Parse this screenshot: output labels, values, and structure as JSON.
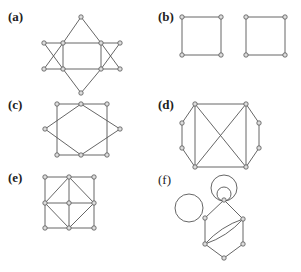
{
  "panels": [
    {
      "id": "a",
      "label": "(a)",
      "label_pos": [
        8,
        21
      ],
      "bold": true,
      "nodes": [
        [
          81,
          17
        ],
        [
          44,
          43
        ],
        [
          63,
          43
        ],
        [
          101,
          43
        ],
        [
          120,
          43
        ],
        [
          44,
          69
        ],
        [
          63,
          69
        ],
        [
          101,
          69
        ],
        [
          120,
          69
        ],
        [
          81,
          93
        ]
      ],
      "edges": [
        [
          0,
          2
        ],
        [
          2,
          6
        ],
        [
          6,
          9
        ],
        [
          0,
          3
        ],
        [
          3,
          7
        ],
        [
          7,
          9
        ],
        [
          1,
          4
        ],
        [
          5,
          8
        ],
        [
          1,
          6
        ],
        [
          2,
          5
        ],
        [
          3,
          8
        ],
        [
          4,
          7
        ]
      ],
      "note": "star of David formed by two triangles with horizontal lines"
    },
    {
      "id": "b",
      "label": "(b)",
      "label_pos": [
        158,
        21
      ],
      "bold": true,
      "nodes": [
        [
          182,
          17
        ],
        [
          221,
          17
        ],
        [
          182,
          55
        ],
        [
          221,
          55
        ],
        [
          246,
          17
        ],
        [
          285,
          17
        ],
        [
          246,
          55
        ],
        [
          285,
          55
        ]
      ],
      "edges": [
        [
          0,
          1
        ],
        [
          1,
          3
        ],
        [
          3,
          2
        ],
        [
          2,
          0
        ],
        [
          4,
          5
        ],
        [
          5,
          7
        ],
        [
          7,
          6
        ],
        [
          6,
          4
        ]
      ]
    },
    {
      "id": "c",
      "label": "(c)",
      "label_pos": [
        8,
        109
      ],
      "bold": true,
      "nodes": [
        [
          57,
          104
        ],
        [
          81,
          104
        ],
        [
          107,
          104
        ],
        [
          45,
          129
        ],
        [
          120,
          129
        ],
        [
          57,
          155
        ],
        [
          81,
          155
        ],
        [
          107,
          155
        ]
      ],
      "edges": [
        [
          0,
          1
        ],
        [
          1,
          2
        ],
        [
          2,
          7
        ],
        [
          7,
          6
        ],
        [
          6,
          5
        ],
        [
          5,
          0
        ],
        [
          1,
          3
        ],
        [
          3,
          6
        ],
        [
          1,
          4
        ],
        [
          4,
          6
        ]
      ]
    },
    {
      "id": "d",
      "label": "(d)",
      "label_pos": [
        158,
        109
      ],
      "bold": true,
      "nodes": [
        [
          195,
          104
        ],
        [
          246,
          104
        ],
        [
          195,
          167
        ],
        [
          246,
          167
        ],
        [
          182,
          123
        ],
        [
          182,
          148
        ],
        [
          259,
          123
        ],
        [
          259,
          148
        ]
      ],
      "edges": [
        [
          0,
          1
        ],
        [
          1,
          3
        ],
        [
          3,
          2
        ],
        [
          2,
          0
        ],
        [
          0,
          3
        ],
        [
          1,
          2
        ],
        [
          0,
          4
        ],
        [
          4,
          5
        ],
        [
          5,
          2
        ],
        [
          1,
          6
        ],
        [
          6,
          7
        ],
        [
          7,
          3
        ]
      ]
    },
    {
      "id": "e",
      "label": "(e)",
      "label_pos": [
        8,
        182
      ],
      "bold": true,
      "nodes": [
        [
          45,
          177
        ],
        [
          69,
          177
        ],
        [
          94,
          177
        ],
        [
          45,
          203
        ],
        [
          69,
          203
        ],
        [
          94,
          203
        ],
        [
          45,
          228
        ],
        [
          69,
          228
        ],
        [
          94,
          228
        ]
      ],
      "edges": [
        [
          0,
          1
        ],
        [
          1,
          2
        ],
        [
          2,
          5
        ],
        [
          5,
          8
        ],
        [
          8,
          7
        ],
        [
          7,
          6
        ],
        [
          6,
          3
        ],
        [
          3,
          0
        ],
        [
          1,
          4
        ],
        [
          4,
          7
        ],
        [
          3,
          4
        ],
        [
          4,
          5
        ],
        [
          1,
          3
        ],
        [
          1,
          5
        ],
        [
          3,
          7
        ],
        [
          5,
          7
        ]
      ]
    },
    {
      "id": "f",
      "label": "(f)",
      "label_pos": [
        158,
        184
      ],
      "bold": false,
      "nodes": [
        [
          224,
          200
        ],
        [
          205,
          218
        ],
        [
          243,
          219
        ],
        [
          205,
          244
        ],
        [
          243,
          244
        ],
        [
          224,
          258
        ]
      ],
      "edges": [
        [
          0,
          1
        ],
        [
          0,
          2
        ],
        [
          1,
          3
        ],
        [
          2,
          4
        ],
        [
          3,
          5
        ],
        [
          4,
          5
        ]
      ],
      "curved_edges": [
        [
          3,
          2,
          "up"
        ],
        [
          3,
          2,
          "down"
        ]
      ],
      "loops": [
        {
          "cx": 224,
          "cy": 188,
          "r": 13
        },
        {
          "cx": 224,
          "cy": 194,
          "r": 7
        },
        {
          "cx": 189,
          "cy": 208,
          "r": 14
        }
      ]
    }
  ]
}
